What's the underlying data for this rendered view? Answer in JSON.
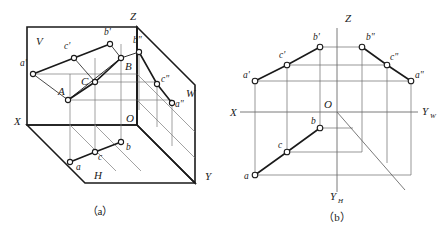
{
  "figure": {
    "stroke_color": "#1a1a1a",
    "thin_color": "#6b6b6b",
    "marker_fill": "#ffffff"
  },
  "captions": {
    "a": "（a）",
    "b": "（b）"
  },
  "diagram_a": {
    "name": "pictorial-projection-planes",
    "plane_labels": [
      {
        "id": "V",
        "text": "V",
        "x": 36,
        "y": 45
      },
      {
        "id": "H",
        "text": "H",
        "x": 94,
        "y": 179
      },
      {
        "id": "W",
        "text": "W",
        "x": 186,
        "y": 97
      }
    ],
    "axis_labels": [
      {
        "id": "Z",
        "text": "Z",
        "x": 130,
        "y": 20
      },
      {
        "id": "X",
        "text": "X",
        "x": 14,
        "y": 125
      },
      {
        "id": "Y",
        "text": "Y",
        "x": 205,
        "y": 180
      },
      {
        "id": "O",
        "text": "O",
        "x": 126,
        "y": 122
      }
    ],
    "points": [
      {
        "id": "a-prime",
        "label": "a'",
        "x": 33,
        "y": 74,
        "lx": 20,
        "ly": 66
      },
      {
        "id": "c-prime",
        "label": "c'",
        "x": 74,
        "y": 58,
        "lx": 64,
        "ly": 49
      },
      {
        "id": "b-prime",
        "label": "b'",
        "x": 110,
        "y": 44,
        "lx": 104,
        "ly": 35
      },
      {
        "id": "A",
        "label": "A",
        "x": 68,
        "y": 100,
        "lx": 58,
        "ly": 95
      },
      {
        "id": "C",
        "label": "C",
        "x": 95,
        "y": 82,
        "lx": 81,
        "ly": 85
      },
      {
        "id": "B",
        "label": "B",
        "x": 121,
        "y": 58,
        "lx": 125,
        "ly": 70
      },
      {
        "id": "b-dbl",
        "label": "b\"",
        "x": 139,
        "y": 52,
        "lx": 133,
        "ly": 43
      },
      {
        "id": "c-dbl",
        "label": "c\"",
        "x": 157,
        "y": 84,
        "lx": 161,
        "ly": 82
      },
      {
        "id": "a-dbl",
        "label": "a\"",
        "x": 172,
        "y": 103,
        "lx": 175,
        "ly": 107
      },
      {
        "id": "a",
        "label": "a",
        "x": 70,
        "y": 162,
        "lx": 76,
        "ly": 170
      },
      {
        "id": "c",
        "label": "c",
        "x": 95,
        "y": 152,
        "lx": 98,
        "ly": 160
      },
      {
        "id": "b",
        "label": "b",
        "x": 121,
        "y": 142,
        "lx": 126,
        "ly": 150
      }
    ]
  },
  "diagram_b": {
    "name": "orthographic-projection-layout",
    "origin": {
      "x": 337,
      "y": 112
    },
    "axis_labels": [
      {
        "id": "Z",
        "text": "Z",
        "x": 345,
        "y": 20
      },
      {
        "id": "X",
        "text": "X",
        "x": 232,
        "y": 116
      },
      {
        "id": "O",
        "text": "O",
        "x": 326,
        "y": 108
      },
      {
        "id": "YW",
        "text": "Y",
        "sub": "W",
        "x": 422,
        "y": 116
      },
      {
        "id": "YH",
        "text": "Y",
        "sub": "H",
        "x": 334,
        "y": 197
      }
    ],
    "points": [
      {
        "id": "a-prime",
        "label": "a'",
        "x": 255,
        "y": 81,
        "lx": 243,
        "ly": 75
      },
      {
        "id": "c-prime",
        "label": "c'",
        "x": 287,
        "y": 65,
        "lx": 279,
        "ly": 56
      },
      {
        "id": "b-prime",
        "label": "b'",
        "x": 320,
        "y": 47,
        "lx": 313,
        "ly": 38
      },
      {
        "id": "b-dbl",
        "label": "b\"",
        "x": 362,
        "y": 47,
        "lx": 366,
        "ly": 38
      },
      {
        "id": "c-dbl",
        "label": "c\"",
        "x": 387,
        "y": 65,
        "lx": 390,
        "ly": 58
      },
      {
        "id": "a-dbl",
        "label": "a\"",
        "x": 411,
        "y": 81,
        "lx": 415,
        "ly": 75
      },
      {
        "id": "b",
        "label": "b",
        "x": 320,
        "y": 128,
        "lx": 312,
        "ly": 123
      },
      {
        "id": "c",
        "label": "c",
        "x": 287,
        "y": 152,
        "lx": 279,
        "ly": 146
      },
      {
        "id": "a",
        "label": "a",
        "x": 255,
        "y": 175,
        "lx": 245,
        "ly": 177
      }
    ]
  }
}
